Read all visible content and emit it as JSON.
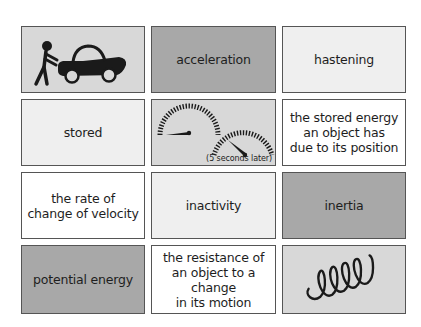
{
  "cards": [
    {
      "id": "car-push",
      "type": "image",
      "icon": "person-pushing-car-icon",
      "bg": "#d8d8d8"
    },
    {
      "id": "acceleration",
      "type": "text",
      "label": "acceleration",
      "bg": "#a8a8a8"
    },
    {
      "id": "hastening",
      "type": "text",
      "label": "hastening",
      "bg": "#efefef"
    },
    {
      "id": "stored",
      "type": "text",
      "label": "stored",
      "bg": "#efefef"
    },
    {
      "id": "speedometers",
      "type": "image",
      "icon": "speedometer-gauges-icon",
      "caption": "(5 seconds later)",
      "bg": "#d8d8d8"
    },
    {
      "id": "potential-energy-definition",
      "type": "text",
      "label": "the stored energy\nan object has\ndue to its position",
      "bg": "#ffffff"
    },
    {
      "id": "acceleration-definition",
      "type": "text",
      "label": "the rate of\nchange of velocity",
      "bg": "#ffffff"
    },
    {
      "id": "inactivity",
      "type": "text",
      "label": "inactivity",
      "bg": "#efefef"
    },
    {
      "id": "inertia",
      "type": "text",
      "label": "inertia",
      "bg": "#a8a8a8"
    },
    {
      "id": "potential-energy",
      "type": "text",
      "label": "potential energy",
      "bg": "#a8a8a8"
    },
    {
      "id": "inertia-definition",
      "type": "text",
      "label": "the resistance of\nan object to a change\nin its motion",
      "bg": "#ffffff"
    },
    {
      "id": "spring",
      "type": "image",
      "icon": "coiled-spring-icon",
      "bg": "#d8d8d8"
    }
  ]
}
